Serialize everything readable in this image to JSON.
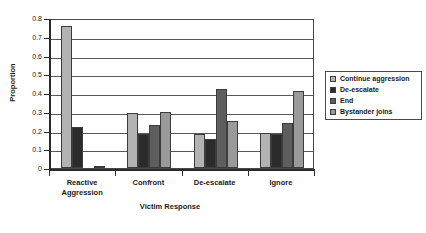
{
  "chart_data": {
    "type": "bar",
    "title": "",
    "xlabel": "Victim Response",
    "ylabel": "Proportion",
    "ylim": [
      0,
      0.8
    ],
    "ytick_labels": [
      "0.8",
      "0.7",
      "0.6",
      "0.5",
      "0.4",
      "0.3",
      "0.2",
      "0.1",
      "0"
    ],
    "ytick_values": [
      0.8,
      0.7,
      0.6,
      0.5,
      0.4,
      0.3,
      0.2,
      0.1,
      0
    ],
    "grid": "horizontal",
    "legend_position": "right",
    "categories": [
      "Reactive\nAggression",
      "Confront",
      "De-escalate",
      "Ignore"
    ],
    "series": [
      {
        "name": "Continue aggression",
        "color": "#b3b3b3",
        "values": [
          0.76,
          0.295,
          0.18,
          0.185
        ]
      },
      {
        "name": "De-escalate",
        "color": "#2b2b2b",
        "values": [
          0.22,
          0.18,
          0.155,
          0.18
        ]
      },
      {
        "name": "End",
        "color": "#5e5e5e",
        "values": [
          0.0,
          0.23,
          0.42,
          0.24
        ]
      },
      {
        "name": "Bystander joins",
        "color": "#9a9a9a",
        "values": [
          0.01,
          0.3,
          0.25,
          0.41
        ]
      }
    ]
  },
  "axis": {
    "y_title": "Proportion",
    "x_title": "Victim Response"
  },
  "legend": {
    "items": [
      {
        "label": "Continue aggression"
      },
      {
        "label": "De-escalate"
      },
      {
        "label": "End"
      },
      {
        "label": "Bystander joins"
      }
    ]
  }
}
